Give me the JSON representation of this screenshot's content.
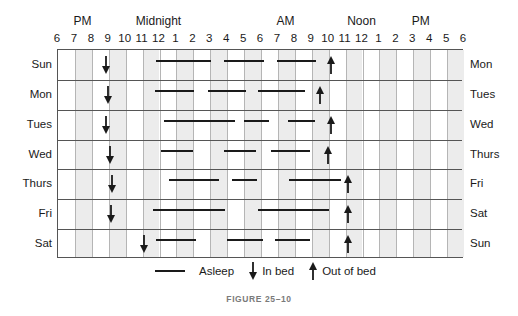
{
  "chart_data": {
    "type": "timeline",
    "title": "",
    "caption": "FIGURE 25–10",
    "x_axis": {
      "unit": "hours from 6 PM",
      "range": [
        0,
        24
      ],
      "tick_labels": [
        "6",
        "7",
        "8",
        "9",
        "10",
        "11",
        "12",
        "1",
        "2",
        "3",
        "4",
        "5",
        "6",
        "7",
        "8",
        "9",
        "10",
        "11",
        "12",
        "1",
        "2",
        "3",
        "4",
        "5",
        "6"
      ],
      "period_labels": [
        {
          "label": "PM",
          "at_hour": 1.5
        },
        {
          "label": "Midnight",
          "at_hour": 6
        },
        {
          "label": "AM",
          "at_hour": 13.5
        },
        {
          "label": "Noon",
          "at_hour": 18
        },
        {
          "label": "PM",
          "at_hour": 21.5
        }
      ]
    },
    "grid": {
      "shaded_columns": true,
      "rows": 7
    },
    "legend": [
      {
        "symbol": "line",
        "label": "Asleep"
      },
      {
        "symbol": "down-arrow",
        "label": "In bed"
      },
      {
        "symbol": "up-arrow",
        "label": "Out of bed"
      }
    ],
    "rows": [
      {
        "start_day": "Sun",
        "end_day": "Mon",
        "in_bed": 2.85,
        "out_of_bed": 16.15,
        "asleep": [
          [
            5.8,
            9.05
          ],
          [
            9.8,
            12.2
          ],
          [
            12.95,
            15.25
          ]
        ]
      },
      {
        "start_day": "Mon",
        "end_day": "Tues",
        "in_bed": 2.95,
        "out_of_bed": 15.5,
        "asleep": [
          [
            5.75,
            8.05
          ],
          [
            8.85,
            11.1
          ],
          [
            11.8,
            14.6
          ]
        ]
      },
      {
        "start_day": "Tues",
        "end_day": "Wed",
        "in_bed": 2.85,
        "out_of_bed": 16.15,
        "asleep": [
          [
            6.25,
            10.45
          ],
          [
            11.0,
            12.45
          ],
          [
            13.6,
            15.2
          ]
        ]
      },
      {
        "start_day": "Wed",
        "end_day": "Thurs",
        "in_bed": 3.05,
        "out_of_bed": 15.95,
        "asleep": [
          [
            6.1,
            8.0
          ],
          [
            9.8,
            11.7
          ],
          [
            12.6,
            14.9
          ]
        ]
      },
      {
        "start_day": "Thurs",
        "end_day": "Fri",
        "in_bed": 3.2,
        "out_of_bed": 17.15,
        "asleep": [
          [
            6.55,
            9.5
          ],
          [
            10.3,
            11.75
          ],
          [
            13.65,
            16.7
          ]
        ]
      },
      {
        "start_day": "Fri",
        "end_day": "Sat",
        "in_bed": 3.15,
        "out_of_bed": 17.15,
        "asleep": [
          [
            5.6,
            9.85
          ],
          [
            11.8,
            16.0
          ]
        ]
      },
      {
        "start_day": "Sat",
        "end_day": "Sun",
        "in_bed": 5.1,
        "out_of_bed": 17.15,
        "asleep": [
          [
            5.8,
            8.15
          ],
          [
            10.0,
            12.1
          ],
          [
            12.8,
            14.9
          ]
        ]
      }
    ]
  },
  "legend": {
    "asleep": "Asleep",
    "in_bed": "In bed",
    "out_of_bed": "Out of bed"
  },
  "caption": "FIGURE 25–10"
}
